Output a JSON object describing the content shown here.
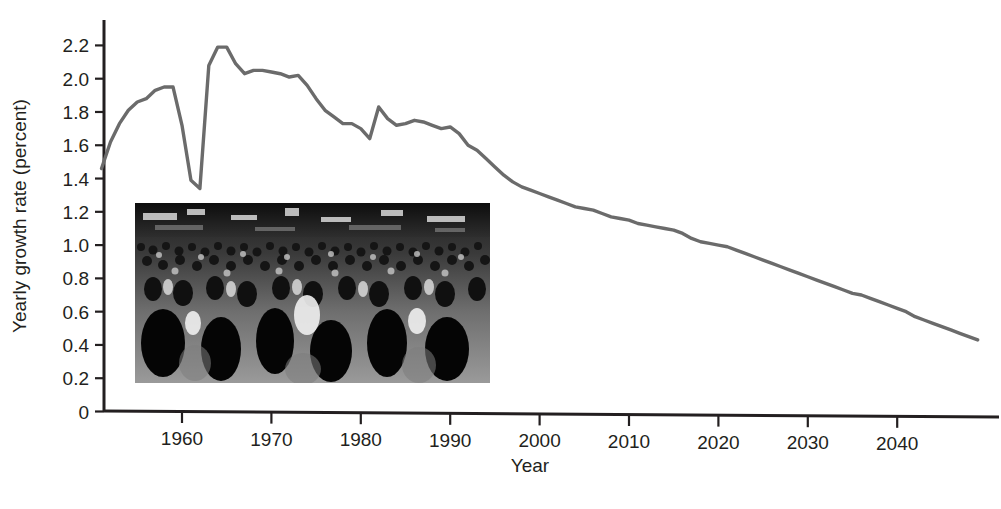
{
  "figure": {
    "background_color": "#ffffff",
    "line_color": "#6b6b6b",
    "axis_color": "#231f20",
    "text_color": "#231f20"
  },
  "chart_data": {
    "type": "line",
    "title": "",
    "xlabel": "Year",
    "ylabel": "Yearly growth rate (percent)",
    "xlim": [
      1951,
      2049
    ],
    "ylim": [
      0,
      2.3
    ],
    "grid": false,
    "legend": null,
    "x_ticks": [
      1960,
      1970,
      1980,
      1990,
      2000,
      2010,
      2020,
      2030,
      2040
    ],
    "x_tick_labels": [
      "1960",
      "1970",
      "1980",
      "1990",
      "2000",
      "2010",
      "2020",
      "2030",
      "2040"
    ],
    "y_ticks": [
      0,
      0.2,
      0.4,
      0.6,
      0.8,
      1.0,
      1.2,
      1.4,
      1.6,
      1.8,
      2.0,
      2.2
    ],
    "y_tick_labels": [
      "0",
      "0.2",
      "0.4",
      "0.6",
      "0.8",
      "1.0",
      "1.2",
      "1.4",
      "1.6",
      "1.8",
      "2.0",
      "2.2"
    ],
    "series": [
      {
        "name": "World yearly population growth rate",
        "color": "#6b6b6b",
        "x": [
          1951,
          1952,
          1953,
          1954,
          1955,
          1956,
          1957,
          1958,
          1959,
          1960,
          1961,
          1962,
          1963,
          1964,
          1965,
          1966,
          1967,
          1968,
          1969,
          1970,
          1971,
          1972,
          1973,
          1974,
          1975,
          1976,
          1977,
          1978,
          1979,
          1980,
          1981,
          1982,
          1983,
          1984,
          1985,
          1986,
          1987,
          1988,
          1989,
          1990,
          1991,
          1992,
          1993,
          1994,
          1995,
          1996,
          1997,
          1998,
          1999,
          2000,
          2001,
          2002,
          2003,
          2004,
          2005,
          2006,
          2007,
          2008,
          2009,
          2010,
          2011,
          2012,
          2013,
          2014,
          2015,
          2016,
          2017,
          2018,
          2019,
          2020,
          2021,
          2022,
          2023,
          2024,
          2025,
          2026,
          2027,
          2028,
          2029,
          2030,
          2031,
          2032,
          2033,
          2034,
          2035,
          2036,
          2037,
          2038,
          2039,
          2040,
          2041,
          2042,
          2043,
          2044,
          2045,
          2046,
          2047,
          2048,
          2049
        ],
        "y": [
          1.46,
          1.62,
          1.73,
          1.81,
          1.86,
          1.88,
          1.93,
          1.95,
          1.95,
          1.72,
          1.39,
          1.34,
          2.08,
          2.19,
          2.19,
          2.09,
          2.03,
          2.05,
          2.05,
          2.04,
          2.03,
          2.01,
          2.02,
          1.96,
          1.88,
          1.81,
          1.77,
          1.73,
          1.73,
          1.7,
          1.64,
          1.83,
          1.76,
          1.72,
          1.73,
          1.75,
          1.74,
          1.72,
          1.7,
          1.71,
          1.67,
          1.6,
          1.57,
          1.52,
          1.47,
          1.42,
          1.38,
          1.35,
          1.33,
          1.31,
          1.29,
          1.27,
          1.25,
          1.23,
          1.22,
          1.21,
          1.19,
          1.17,
          1.16,
          1.15,
          1.13,
          1.12,
          1.11,
          1.1,
          1.09,
          1.07,
          1.04,
          1.02,
          1.01,
          1.0,
          0.99,
          0.97,
          0.95,
          0.93,
          0.91,
          0.89,
          0.87,
          0.85,
          0.83,
          0.81,
          0.79,
          0.77,
          0.75,
          0.73,
          0.71,
          0.7,
          0.68,
          0.66,
          0.64,
          0.62,
          0.6,
          0.57,
          0.55,
          0.53,
          0.51,
          0.49,
          0.47,
          0.45,
          0.43
        ]
      }
    ]
  },
  "inset": {
    "name": "crowd-photograph",
    "description": "Black and white photograph of a dense crowd of people filling a city street with shop signs above"
  }
}
